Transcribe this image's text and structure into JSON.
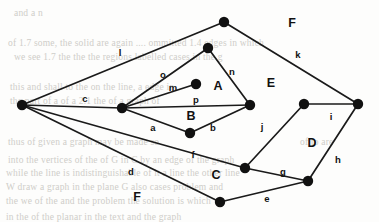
{
  "figure": {
    "type": "planar-graph-diagram",
    "width": 379,
    "height": 222,
    "background_color": "#fdfdfc",
    "ink_color": "#111111"
  },
  "graph_data": {
    "type": "graph",
    "title": "",
    "description": "Planar graph drawing with labelled edges a-p and labelled faces A-F",
    "vertices": [
      {
        "id": "v1",
        "x": 22,
        "y": 105,
        "label": ""
      },
      {
        "id": "v2",
        "x": 122,
        "y": 108,
        "label": ""
      },
      {
        "id": "v3",
        "x": 224,
        "y": 22,
        "label": ""
      },
      {
        "id": "v4",
        "x": 208,
        "y": 48,
        "label": ""
      },
      {
        "id": "v5",
        "x": 196,
        "y": 84,
        "label": ""
      },
      {
        "id": "v6",
        "x": 250,
        "y": 105,
        "label": ""
      },
      {
        "id": "v7",
        "x": 190,
        "y": 133,
        "label": ""
      },
      {
        "id": "v8",
        "x": 245,
        "y": 168,
        "label": ""
      },
      {
        "id": "v9",
        "x": 308,
        "y": 181,
        "label": ""
      },
      {
        "id": "v10",
        "x": 220,
        "y": 202,
        "label": ""
      },
      {
        "id": "v11",
        "x": 304,
        "y": 104,
        "label": ""
      },
      {
        "id": "v12",
        "x": 358,
        "y": 104,
        "label": ""
      }
    ],
    "vertex_radius": 5.2,
    "edges": [
      {
        "id": "a",
        "label": "a",
        "from": "v2",
        "to": "v7",
        "label_x": 153,
        "label_y": 128
      },
      {
        "id": "b",
        "label": "b",
        "from": "v7",
        "to": "v6",
        "label_x": 213,
        "label_y": 128
      },
      {
        "id": "c",
        "label": "c",
        "from": "v1",
        "to": "v2",
        "label_x": 85,
        "label_y": 99
      },
      {
        "id": "d",
        "label": "d",
        "from": "v1",
        "to": "v10",
        "label_x": 131,
        "label_y": 172
      },
      {
        "id": "e",
        "label": "e",
        "from": "v10",
        "to": "v9",
        "label_x": 267,
        "label_y": 199
      },
      {
        "id": "f",
        "label": "f",
        "from": "v1",
        "to": "v8",
        "label_x": 193,
        "label_y": 155
      },
      {
        "id": "g",
        "label": "g",
        "from": "v8",
        "to": "v9",
        "label_x": 283,
        "label_y": 172
      },
      {
        "id": "h",
        "label": "h",
        "from": "v9",
        "to": "v12",
        "label_x": 338,
        "label_y": 160
      },
      {
        "id": "i",
        "label": "i",
        "from": "v11",
        "to": "v12",
        "label_x": 331,
        "label_y": 117
      },
      {
        "id": "j",
        "label": "j",
        "from": "v8",
        "to": "v11",
        "label_x": 262,
        "label_y": 127
      },
      {
        "id": "k",
        "label": "k",
        "from": "v3",
        "to": "v12",
        "label_x": 298,
        "label_y": 55
      },
      {
        "id": "l",
        "label": "l",
        "from": "v1",
        "to": "v3",
        "label_x": 120,
        "label_y": 53
      },
      {
        "id": "m",
        "label": "m",
        "from": "v2",
        "to": "v5",
        "label_x": 173,
        "label_y": 88
      },
      {
        "id": "n",
        "label": "n",
        "from": "v4",
        "to": "v6",
        "label_x": 232,
        "label_y": 72
      },
      {
        "id": "o",
        "label": "o",
        "from": "v2",
        "to": "v4",
        "label_x": 163,
        "label_y": 75
      },
      {
        "id": "p",
        "label": "p",
        "from": "v2",
        "to": "v6",
        "label_x": 196,
        "label_y": 100
      }
    ],
    "faces": [
      {
        "id": "A",
        "label": "A",
        "x": 218,
        "y": 87
      },
      {
        "id": "B",
        "label": "B",
        "x": 191,
        "y": 117
      },
      {
        "id": "C",
        "label": "C",
        "x": 216,
        "y": 176
      },
      {
        "id": "D",
        "label": "D",
        "x": 312,
        "y": 144
      },
      {
        "id": "E",
        "label": "E",
        "x": 271,
        "y": 84
      },
      {
        "id": "F1",
        "label": "F",
        "x": 292,
        "y": 24
      },
      {
        "id": "F2",
        "label": "F",
        "x": 137,
        "y": 198
      }
    ]
  },
  "background_scan": {
    "note": "faint show-through text from the reverse of the scanned page",
    "lines": [
      {
        "text": "and a n",
        "x": 14,
        "y": 8
      },
      {
        "text": "of  1.7 some, the solid are again  ....  ommitted  1.4 edges in which",
        "x": 8,
        "y": 38
      },
      {
        "text": "we see  1.7 the the  the regions labelled cases in the g",
        "x": 14,
        "y": 52
      },
      {
        "text": "this  and shall to  the  on the  line, a  edge  in",
        "x": 10,
        "y": 82
      },
      {
        "text": "the  part of a  of  a  2.1 the  of a graph of",
        "x": 10,
        "y": 96
      },
      {
        "text": "thus  of  given  a  graph  may  be  made  so",
        "x": 8,
        "y": 137
      },
      {
        "text": "of  to  are",
        "x": 300,
        "y": 137
      },
      {
        "text": "into the  vertices of  the  of  G  in  C   by  an  edge of the graph",
        "x": 8,
        "y": 155
      },
      {
        "text": "while  the  line  is  indistinguishable  of  it  a  line  the  other  line",
        "x": 6,
        "y": 168
      },
      {
        "text": "W  draw  a  graph  in  the  plane  G   also  cases  problem  and",
        "x": 6,
        "y": 182
      },
      {
        "text": "the  we  of  the  and  the  problem  the  solution  is  which",
        "x": 6,
        "y": 196
      },
      {
        "text": "in  the  of  the  planar  in  the  text  and  the  graph",
        "x": 6,
        "y": 212
      }
    ]
  }
}
